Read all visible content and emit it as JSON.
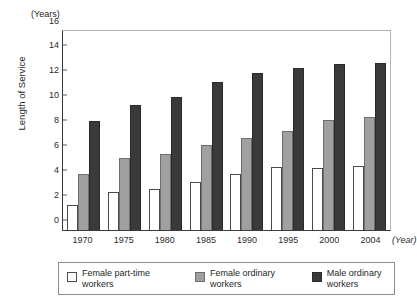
{
  "chart_data": {
    "type": "bar",
    "title": "",
    "xlabel": "(Year)",
    "ylabel": "Length of Service",
    "yunit": "(Years)",
    "ylim": [
      0,
      16
    ],
    "ytick_step": 2,
    "yticks": [
      16,
      14,
      12,
      10,
      8,
      6,
      4,
      2,
      0
    ],
    "grid": false,
    "legend_position": "bottom",
    "categories": [
      "1970",
      "1975",
      "1980",
      "1985",
      "1990",
      "1995",
      "2000",
      "2004"
    ],
    "series": [
      {
        "name": "Female part-time workers",
        "name_line1": "Female part-time",
        "name_line2": "workers",
        "color": "#ffffff",
        "border_color": "#4a4a4a",
        "values": [
          2.0,
          3.05,
          3.3,
          3.9,
          4.5,
          5.05,
          4.95,
          5.15
        ]
      },
      {
        "name": "Female ordinary workers",
        "name_line1": "Female ordinary",
        "name_line2": "workers",
        "color": "#a0a0a0",
        "border_color": "#6e6e6e",
        "values": [
          4.5,
          5.8,
          6.1,
          6.8,
          7.4,
          8.0,
          8.85,
          9.05
        ]
      },
      {
        "name": "Male ordinary workers",
        "name_line1": "Male ordinary",
        "name_line2": "workers",
        "color": "#3a3a3a",
        "border_color": "#2a2a2a",
        "values": [
          8.8,
          10.05,
          10.7,
          11.9,
          12.6,
          13.0,
          13.35,
          13.45
        ]
      }
    ]
  }
}
